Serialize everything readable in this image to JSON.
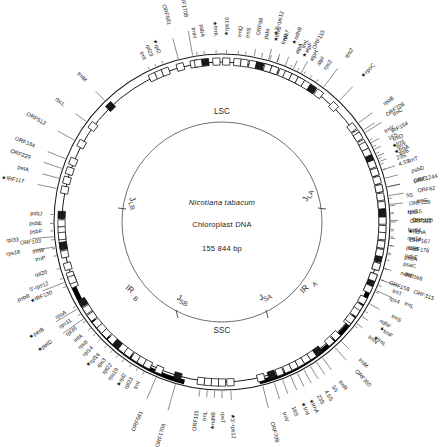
{
  "figure": {
    "type": "circular-genome-map",
    "center": {
      "species": "Nicotiana tabacum",
      "molecule": "Chloroplast DNA",
      "size": "155 844 bp"
    },
    "regions": [
      {
        "id": "LSC",
        "label": "LSC",
        "name": "large-single-copy"
      },
      {
        "id": "SSC",
        "label": "SSC",
        "name": "small-single-copy"
      },
      {
        "id": "IRA",
        "label": "IR",
        "sub": "A",
        "name": "inverted-repeat-a"
      },
      {
        "id": "IRB",
        "label": "IR",
        "sub": "B",
        "name": "inverted-repeat-b"
      }
    ],
    "junctions": [
      {
        "id": "JLA",
        "label": "J",
        "sub": "LA"
      },
      {
        "id": "JLB",
        "label": "J",
        "sub": "LB"
      },
      {
        "id": "JSA",
        "label": "J",
        "sub": "SA"
      },
      {
        "id": "JSB",
        "label": "J",
        "sub": "SB"
      }
    ],
    "colors": {
      "backbone": "#1c1c1c",
      "inverted_repeat": "#000000",
      "gene_outline": "#141414",
      "gene_fill": "#ffffff",
      "text": "#161616"
    },
    "genes": [
      {
        "label": "trnM",
        "angle": 316.0,
        "radius": 196,
        "starred": false
      },
      {
        "label": "rbcL",
        "angle": 306.5,
        "radius": 196,
        "starred": false
      },
      {
        "label": "ORF512",
        "angle": 299.0,
        "radius": 202,
        "starred": false
      },
      {
        "label": "ORF184",
        "angle": 292.0,
        "radius": 202,
        "starred": false
      },
      {
        "label": "ORF229",
        "angle": 288.5,
        "radius": 202,
        "starred": false
      },
      {
        "label": "petA",
        "angle": 285.0,
        "radius": 200,
        "starred": false
      },
      {
        "label": "IRF117",
        "angle": 281.5,
        "radius": 202,
        "starred": true
      },
      {
        "label": "psbJ",
        "angle": 272.5,
        "radius": 180,
        "starred": false
      },
      {
        "label": "psbE",
        "angle": 269.5,
        "radius": 180,
        "starred": false
      },
      {
        "label": "psbF",
        "angle": 267.0,
        "radius": 180,
        "starred": false
      },
      {
        "label": "ORF103",
        "angle": 264.0,
        "radius": 182,
        "starred": false
      },
      {
        "label": "trnW",
        "angle": 261.0,
        "radius": 180,
        "starred": false
      },
      {
        "label": "trnP",
        "angle": 258.5,
        "radius": 180,
        "starred": false
      },
      {
        "label": "rpl33",
        "angle": 265.0,
        "radius": 204,
        "starred": false
      },
      {
        "label": "rps18",
        "angle": 261.5,
        "radius": 204,
        "starred": false
      },
      {
        "label": "rpl20",
        "angle": 254.0,
        "radius": 182,
        "starred": false
      },
      {
        "label": "5'-rps12",
        "angle": 250.5,
        "radius": 184,
        "starred": false
      },
      {
        "label": "IRF130",
        "angle": 247.5,
        "radius": 184,
        "starred": true
      },
      {
        "label": "psbB",
        "angle": 249.0,
        "radius": 206,
        "starred": false
      },
      {
        "label": "petB",
        "angle": 239.0,
        "radius": 208,
        "starred": true
      },
      {
        "label": "petD",
        "angle": 235.0,
        "radius": 208,
        "starred": true
      },
      {
        "label": "rpoA",
        "angle": 240.0,
        "radius": 180,
        "starred": false
      },
      {
        "label": "rps11",
        "angle": 237.0,
        "radius": 180,
        "starred": false
      },
      {
        "label": "rpl36",
        "angle": 234.0,
        "radius": 180,
        "starred": false
      },
      {
        "label": "infA",
        "angle": 231.0,
        "radius": 180,
        "starred": false
      },
      {
        "label": "rps8",
        "angle": 228.5,
        "radius": 180,
        "starred": false
      },
      {
        "label": "rpl14",
        "angle": 226.0,
        "radius": 180,
        "starred": false
      },
      {
        "label": "rpl16",
        "angle": 223.0,
        "radius": 180,
        "starred": true
      },
      {
        "label": "rps3",
        "angle": 220.5,
        "radius": 180,
        "starred": false
      },
      {
        "label": "rpl22",
        "angle": 218.0,
        "radius": 180,
        "starred": false
      },
      {
        "label": "rps19",
        "angle": 215.5,
        "radius": 180,
        "starred": false
      },
      {
        "label": "rpl2",
        "angle": 212.5,
        "radius": 180,
        "starred": true
      },
      {
        "label": "rpl23",
        "angle": 210.0,
        "radius": 180,
        "starred": false
      },
      {
        "label": "trnI",
        "angle": 207.5,
        "radius": 180,
        "starred": false
      },
      {
        "label": "ORF581",
        "angle": 203.0,
        "radius": 206,
        "starred": false
      },
      {
        "label": "ORF1708",
        "angle": 196.0,
        "radius": 210,
        "starred": false
      },
      {
        "label": "ORF115",
        "angle": 187.5,
        "radius": 190,
        "starred": false
      },
      {
        "label": "trnL",
        "angle": 185.0,
        "radius": 190,
        "starred": false
      },
      {
        "label": "ndhB",
        "angle": 182.5,
        "radius": 190,
        "starred": true
      },
      {
        "label": "rps7",
        "angle": 180.0,
        "radius": 190,
        "starred": false
      },
      {
        "label": "3'-rps12",
        "angle": 177.0,
        "radius": 192,
        "starred": true
      },
      {
        "label": "ORF708",
        "angle": 166.0,
        "radius": 206,
        "starred": false
      },
      {
        "label": "trnV",
        "angle": 162.0,
        "radius": 200,
        "starred": false
      },
      {
        "label": "16S",
        "angle": 159.0,
        "radius": 198,
        "starred": false
      },
      {
        "label": "trnI",
        "angle": 156.0,
        "radius": 198,
        "starred": true
      },
      {
        "label": "trnA",
        "angle": 153.5,
        "radius": 198,
        "starred": true
      },
      {
        "label": "23S",
        "angle": 151.0,
        "radius": 198,
        "starred": false
      },
      {
        "label": "4.5S",
        "angle": 148.5,
        "radius": 198,
        "starred": false
      },
      {
        "label": "5S",
        "angle": 146.0,
        "radius": 198,
        "starred": false
      },
      {
        "label": "trnR",
        "angle": 143.5,
        "radius": 198,
        "starred": false
      },
      {
        "label": "ORF350",
        "angle": 138.0,
        "radius": 200,
        "starred": false
      },
      {
        "label": "trnN",
        "angle": 128.0,
        "radius": 186,
        "starred": false
      },
      {
        "label": "ndhF",
        "angle": 122.0,
        "radius": 186,
        "starred": false
      },
      {
        "label": "trnL",
        "angle": 114.0,
        "radius": 200,
        "starred": false
      },
      {
        "label": "ORF313",
        "angle": 110.0,
        "radius": 204,
        "starred": false
      },
      {
        "label": "ndhD",
        "angle": 106.0,
        "radius": 186,
        "starred": false
      },
      {
        "label": "psaC",
        "angle": 103.0,
        "radius": 186,
        "starred": false
      },
      {
        "label": "ndhE",
        "angle": 100.5,
        "radius": 186,
        "starred": false
      },
      {
        "label": "ORF176",
        "angle": 98.0,
        "radius": 188,
        "starred": false
      },
      {
        "label": "ORF167",
        "angle": 95.5,
        "radius": 188,
        "starred": false
      },
      {
        "label": "ndhA",
        "angle": 93.0,
        "radius": 186,
        "starred": true
      },
      {
        "label": "ORF393",
        "angle": 90.0,
        "radius": 188,
        "starred": false
      },
      {
        "label": "rps15",
        "angle": 87.0,
        "radius": 186,
        "starred": false
      },
      {
        "label": "ORF228",
        "angle": 84.5,
        "radius": 188,
        "starred": false
      },
      {
        "label": "5S",
        "angle": 82.0,
        "radius": 186,
        "starred": false
      },
      {
        "label": "ORF1244",
        "angle": 78.0,
        "radius": 196,
        "starred": false
      },
      {
        "label": "4.5S",
        "angle": 72.0,
        "radius": 186,
        "starred": false
      },
      {
        "label": "23S",
        "angle": 70.0,
        "radius": 186,
        "starred": false
      },
      {
        "label": "trnA",
        "angle": 68.0,
        "radius": 186,
        "starred": true
      },
      {
        "label": "trnI",
        "angle": 66.0,
        "radius": 186,
        "starred": true
      },
      {
        "label": "16S",
        "angle": 63.5,
        "radius": 186,
        "starred": false
      },
      {
        "label": "trnV",
        "angle": 61.0,
        "radius": 186,
        "starred": false
      },
      {
        "label": "ORF708",
        "angle": 57.0,
        "radius": 196,
        "starred": false
      },
      {
        "label": "3'-rps12",
        "angle": 16.0,
        "radius": 194,
        "starred": true
      },
      {
        "label": "rps7",
        "angle": 19.0,
        "radius": 192,
        "starred": false
      },
      {
        "label": "ndhB",
        "angle": 22.0,
        "radius": 192,
        "starred": true
      },
      {
        "label": "trnL",
        "angle": 25.0,
        "radius": 192,
        "starred": false
      },
      {
        "label": "ORF115",
        "angle": 28.0,
        "radius": 196,
        "starred": false
      },
      {
        "label": "ORF1708",
        "angle": 345.0,
        "radius": 0,
        "starred": false
      },
      {
        "label": "trnI",
        "angle": 334.5,
        "radius": 180,
        "starred": false
      },
      {
        "label": "rpl23",
        "angle": 337.0,
        "radius": 180,
        "starred": false
      },
      {
        "label": "rpl2",
        "angle": 339.5,
        "radius": 180,
        "starred": true
      },
      {
        "label": "ORF581",
        "angle": 345.0,
        "radius": 204,
        "starred": false
      },
      {
        "label": "ORF1708",
        "angle": 350.0,
        "radius": 208,
        "starred": false
      },
      {
        "label": "psbA",
        "angle": 354.0,
        "radius": 186,
        "starred": false
      },
      {
        "label": "trnH",
        "angle": 351.5,
        "radius": 186,
        "starred": false
      },
      {
        "label": "trnK",
        "angle": 358.0,
        "radius": 186,
        "starred": true
      },
      {
        "label": "rps16",
        "angle": 1.5,
        "radius": 186,
        "starred": true
      },
      {
        "label": "trnQ",
        "angle": 5.5,
        "radius": 186,
        "starred": false
      },
      {
        "label": "trnS",
        "angle": 8.0,
        "radius": 186,
        "starred": false
      },
      {
        "label": "ORF98",
        "angle": 11.0,
        "radius": 190,
        "starred": false
      },
      {
        "label": "psbI",
        "angle": 13.5,
        "radius": 188,
        "starred": false
      },
      {
        "label": "trnG",
        "angle": 16.5,
        "radius": 188,
        "starred": true
      },
      {
        "label": "trnR",
        "angle": 19.0,
        "radius": 188,
        "starred": false
      },
      {
        "label": "atpA",
        "angle": 24.0,
        "radius": 184,
        "starred": false
      },
      {
        "label": "atpF",
        "angle": 26.5,
        "radius": 184,
        "starred": true
      },
      {
        "label": "atpH",
        "angle": 29.0,
        "radius": 184,
        "starred": false
      },
      {
        "label": "atpI",
        "angle": 31.5,
        "radius": 184,
        "starred": false
      },
      {
        "label": "rps2",
        "angle": 34.0,
        "radius": 184,
        "starred": false
      },
      {
        "label": "rps2",
        "angle": 37.0,
        "radius": 206,
        "starred": false
      },
      {
        "label": "rpoC",
        "angle": 44.0,
        "radius": 202,
        "starred": true
      },
      {
        "label": "rpoB",
        "angle": 54.0,
        "radius": 200,
        "starred": false
      },
      {
        "label": "trnC",
        "angle": 58.0,
        "radius": 202,
        "starred": false
      },
      {
        "label": "IRF154",
        "angle": 62.0,
        "radius": 192,
        "starred": false
      },
      {
        "label": "trnD",
        "angle": 64.5,
        "radius": 190,
        "starred": false
      },
      {
        "label": "trnY",
        "angle": 67.0,
        "radius": 190,
        "starred": false
      },
      {
        "label": "trnE",
        "angle": 69.0,
        "radius": 190,
        "starred": false
      },
      {
        "label": "trnT",
        "angle": 72.0,
        "radius": 196,
        "starred": false
      },
      {
        "label": "psbD",
        "angle": 75.0,
        "radius": 196,
        "starred": false
      },
      {
        "label": "psbC",
        "angle": 78.0,
        "radius": 196,
        "starred": false
      },
      {
        "label": "ORF62",
        "angle": 81.0,
        "radius": 198,
        "starred": false
      },
      {
        "label": "trnG",
        "angle": 84.0,
        "radius": 196,
        "starred": false
      },
      {
        "label": "trnS",
        "angle": 87.0,
        "radius": 186,
        "starred": false
      },
      {
        "label": "ORF105",
        "angle": 89.5,
        "radius": 190,
        "starred": false
      },
      {
        "label": "trnfM",
        "angle": 92.5,
        "radius": 186,
        "starred": false
      },
      {
        "label": "rps14",
        "angle": 95.0,
        "radius": 186,
        "starred": false
      },
      {
        "label": "psaB",
        "angle": 98.0,
        "radius": 186,
        "starred": false
      },
      {
        "label": "psaA",
        "angle": 101.0,
        "radius": 186,
        "starred": false
      },
      {
        "label": "IRF168",
        "angle": 106.0,
        "radius": 190,
        "starred": false
      },
      {
        "label": "trnT",
        "angle": 112.0,
        "radius": 184,
        "starred": false
      },
      {
        "label": "rps4",
        "angle": 114.5,
        "radius": 184,
        "starred": false
      },
      {
        "label": "ORF158",
        "angle": 110.0,
        "radius": 178,
        "starred": false
      },
      {
        "label": "trnS",
        "angle": 119.0,
        "radius": 194,
        "starred": false
      },
      {
        "label": "trnF",
        "angle": 124.0,
        "radius": 190,
        "starred": true
      },
      {
        "label": "trnL",
        "angle": 127.0,
        "radius": 190,
        "starred": true
      },
      {
        "label": "trnM",
        "angle": 135.0,
        "radius": 194,
        "starred": false
      }
    ]
  }
}
